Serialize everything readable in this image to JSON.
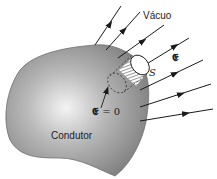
{
  "diagram": {
    "type": "electrostatics-conductor",
    "labels": {
      "vacuum": "Vácuo",
      "field": "𝕰",
      "surface": "S",
      "field_inside_symbol": "𝕰",
      "field_inside_value": " = 0",
      "conductor": "Condutor"
    },
    "colors": {
      "conductor_fill": "#8f8f8f",
      "conductor_highlight": "#f2f2f2",
      "line": "#1a1a1a",
      "background": "#ffffff"
    },
    "field_lines_count": 7
  }
}
